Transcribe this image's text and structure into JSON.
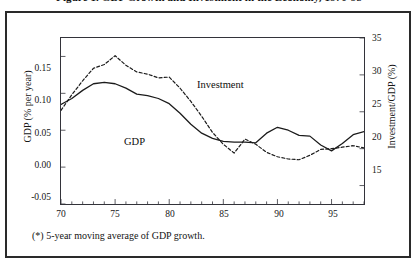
{
  "figure": {
    "title": "Figure 1. GDP Growth and Investment in the Economy, 1970-98",
    "footnote": "(*) 5-year moving average of GDP growth."
  },
  "axes": {
    "y_left": {
      "title": "GDP (% per year)",
      "ticks": [
        "0.15",
        "0.10",
        "0.05",
        "0.00",
        "-0.05"
      ],
      "range": [
        -0.05,
        0.175
      ]
    },
    "y_right": {
      "title": "Investment/GDP (%)",
      "ticks": [
        "35",
        "30",
        "25",
        "20",
        "15"
      ],
      "range": [
        12.5,
        35
      ]
    },
    "x": {
      "ticks": [
        "70",
        "75",
        "80",
        "85",
        "90",
        "95"
      ],
      "range": [
        70,
        98
      ]
    }
  },
  "series_labels": {
    "investment": "Investment",
    "gdp": "GDP"
  },
  "colors": {
    "line": "#1b1b1b",
    "frame": "#33333a",
    "outer_frame": "#2a2a2a",
    "background": "#ffffff"
  },
  "chart_data": {
    "type": "line",
    "title": "Figure 1. GDP Growth and Investment in the Economy, 1970-98",
    "xlabel": "",
    "ylabel": "GDP (% per year)",
    "ylabel_right": "Investment/GDP (%)",
    "xlim": [
      70,
      98
    ],
    "ylim": [
      -0.05,
      0.175
    ],
    "ylim_right": [
      12.5,
      35
    ],
    "grid": false,
    "legend": "inline-annotations",
    "x": [
      70,
      71,
      72,
      73,
      74,
      75,
      76,
      77,
      78,
      79,
      80,
      81,
      82,
      83,
      84,
      85,
      86,
      87,
      88,
      89,
      90,
      91,
      92,
      93,
      94,
      95,
      96,
      97,
      98
    ],
    "series": [
      {
        "name": "GDP",
        "axis": "left",
        "style": "solid",
        "values": [
          0.085,
          0.093,
          0.104,
          0.113,
          0.115,
          0.113,
          0.107,
          0.099,
          0.097,
          0.093,
          0.086,
          0.073,
          0.058,
          0.046,
          0.039,
          0.035,
          0.034,
          0.034,
          0.033,
          0.046,
          0.054,
          0.05,
          0.043,
          0.042,
          0.03,
          0.022,
          0.032,
          0.044,
          0.048
        ]
      },
      {
        "name": "Investment",
        "axis": "right",
        "style": "dashed",
        "values": [
          25.2,
          27.3,
          29.2,
          30.9,
          31.4,
          32.6,
          31.3,
          30.4,
          30.1,
          29.6,
          29.7,
          28.2,
          26.4,
          24.4,
          22.2,
          20.6,
          19.4,
          21.3,
          20.6,
          19.5,
          18.9,
          18.6,
          18.5,
          19.1,
          19.9,
          20.0,
          20.2,
          20.4,
          20.1
        ]
      }
    ],
    "series_right_tail": {
      "GDP": [
        0.044,
        0.036,
        0.028
      ],
      "Investment": [
        20.2,
        19.6,
        18.9
      ]
    }
  }
}
